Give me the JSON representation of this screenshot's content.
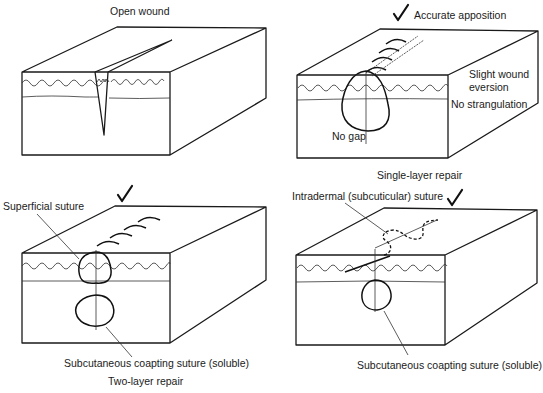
{
  "figure": {
    "panels": [
      {
        "id": "open-wound",
        "title": "Open wound",
        "labels": []
      },
      {
        "id": "single-layer",
        "title": "Accurate apposition",
        "caption": "Single-layer repair",
        "checkmark": true,
        "labels": [
          "Slight wound",
          "eversion",
          "No strangulation",
          "No gap"
        ]
      },
      {
        "id": "two-layer",
        "caption": "Two-layer repair",
        "checkmark": true,
        "labels": [
          "Superficial suture",
          "Subcutaneous coapting suture (soluble)"
        ]
      },
      {
        "id": "intradermal",
        "checkmark": true,
        "labels": [
          "Intradermal (subcuticular) suture",
          "Subcutaneous coapting suture (soluble)"
        ]
      }
    ]
  }
}
